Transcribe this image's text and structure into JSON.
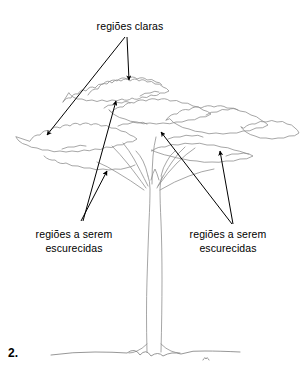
{
  "figure": {
    "number": "2.",
    "background_color": "#ffffff",
    "ink_color": "#000000",
    "sketch_color": "#8a8a8a"
  },
  "labels": {
    "top": {
      "text": "regiões claras",
      "name": "label-regioes-claras"
    },
    "bottom_left": {
      "line1": "regiões a serem",
      "line2": "escurecidas",
      "name": "label-escurecidas-left"
    },
    "bottom_right": {
      "line1": "regiões a serem",
      "line2": "escurecidas",
      "name": "label-escurecidas-right"
    }
  },
  "annotations": {
    "arrows": [
      {
        "id": "arrow-claras-down",
        "from_label": "regiões claras",
        "x1": 127,
        "y1": 37,
        "x2": 129,
        "y2": 81
      },
      {
        "id": "arrow-claras-left",
        "from_label": "regiões claras",
        "x1": 125,
        "y1": 37,
        "x2": 46,
        "y2": 136
      },
      {
        "id": "arrow-escurecidas-l-up",
        "from_label": "regiões a serem escurecidas",
        "x1": 83,
        "y1": 221,
        "x2": 116,
        "y2": 100
      },
      {
        "id": "arrow-escurecidas-l-mid",
        "from_label": "regiões a serem escurecidas",
        "x1": 81,
        "y1": 221,
        "x2": 107,
        "y2": 170
      },
      {
        "id": "arrow-escurecidas-r-up",
        "from_label": "regiões a serem escurecidas",
        "x1": 232,
        "y1": 224,
        "x2": 160,
        "y2": 131
      },
      {
        "id": "arrow-escurecidas-r-mid",
        "from_label": "regiões a serem escurecidas",
        "x1": 233,
        "y1": 224,
        "x2": 220,
        "y2": 150
      }
    ]
  },
  "drawing": {
    "canopy_extent": {
      "left": 28,
      "right": 291,
      "top": 72,
      "bottom": 175
    },
    "trunk": {
      "top": 150,
      "base": 352,
      "fork_y": 185
    },
    "ground_line_y": 352
  }
}
